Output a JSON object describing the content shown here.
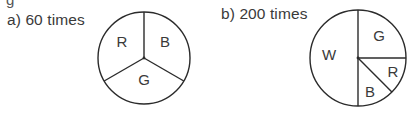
{
  "header": {
    "cut_off_text": "g"
  },
  "spinners": [
    {
      "id": "a",
      "label": "a)  60 times",
      "trials": 60,
      "center": [
        144,
        58
      ],
      "radius": 46,
      "sectors": [
        {
          "letter": "R",
          "meaning": "red",
          "start_deg": 90,
          "end_deg": 210,
          "fraction": "1/3"
        },
        {
          "letter": "B",
          "meaning": "blue",
          "start_deg": -30,
          "end_deg": 90,
          "fraction": "1/3"
        },
        {
          "letter": "G",
          "meaning": "green",
          "start_deg": 210,
          "end_deg": 330,
          "fraction": "1/3"
        }
      ]
    },
    {
      "id": "b",
      "label": "b)  200 times",
      "trials": 200,
      "center": [
        358,
        58
      ],
      "radius": 48,
      "sectors": [
        {
          "letter": "W",
          "meaning": "white",
          "start_deg": 90,
          "end_deg": 270,
          "fraction": "1/2"
        },
        {
          "letter": "G",
          "meaning": "green",
          "start_deg": 0,
          "end_deg": 90,
          "fraction": "1/4"
        },
        {
          "letter": "R",
          "meaning": "red",
          "start_deg": -45,
          "end_deg": 0,
          "fraction": "1/8"
        },
        {
          "letter": "B",
          "meaning": "blue",
          "start_deg": -90,
          "end_deg": -45,
          "fraction": "1/8"
        }
      ]
    }
  ],
  "colors": {
    "stroke": "#2b2b2b",
    "text": "#3a3a3a",
    "background": "#ffffff"
  }
}
